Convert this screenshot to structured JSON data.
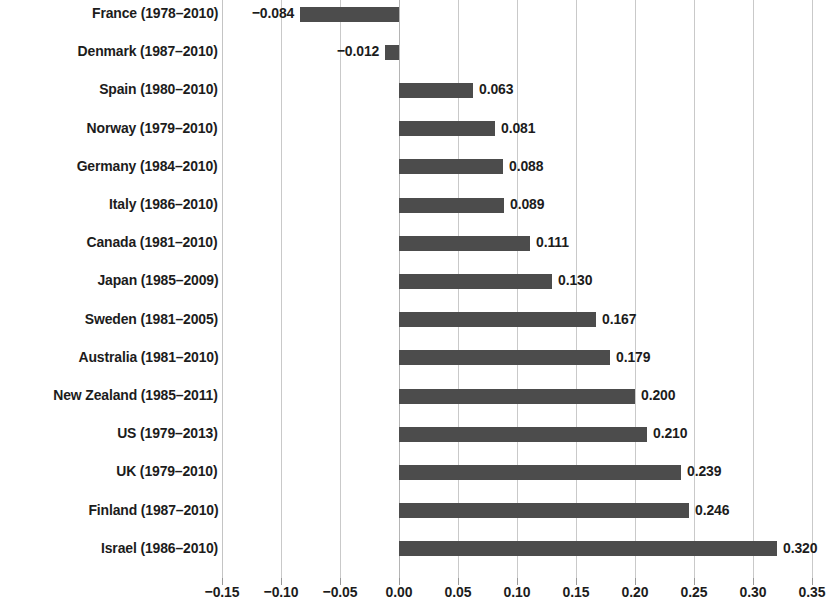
{
  "chart_data": {
    "type": "bar",
    "orientation": "horizontal",
    "title": "",
    "subtitle": "",
    "xlabel": "",
    "ylabel": "",
    "xlim": [
      -0.15,
      0.35
    ],
    "xticks": [
      "-0.15",
      "-0.10",
      "-0.05",
      "0.00",
      "0.05",
      "0.10",
      "0.15",
      "0.20",
      "0.25",
      "0.30",
      "0.35"
    ],
    "xtick_values": [
      -0.15,
      -0.1,
      -0.05,
      0.0,
      0.05,
      0.1,
      0.15,
      0.2,
      0.25,
      0.3,
      0.35
    ],
    "grid": "vertical",
    "legend": "none",
    "bar_color": "#4c4c4c",
    "categories": [
      "France (1978–2010)",
      "Denmark (1987–2010)",
      "Spain (1980–2010)",
      "Norway (1979–2010)",
      "Germany (1984–2010)",
      "Italy (1986–2010)",
      "Canada (1981–2010)",
      "Japan (1985–2009)",
      "Sweden (1981–2005)",
      "Australia (1981–2010)",
      "New Zealand (1985–2011)",
      "US (1979–2013)",
      "UK (1979–2010)",
      "Finland (1987–2010)",
      "Israel (1986–2010)"
    ],
    "values": [
      -0.084,
      -0.012,
      0.063,
      0.081,
      0.088,
      0.089,
      0.111,
      0.13,
      0.167,
      0.179,
      0.2,
      0.21,
      0.239,
      0.246,
      0.32
    ],
    "value_labels": [
      "−0.084",
      "−0.012",
      "0.063",
      "0.081",
      "0.088",
      "0.089",
      "0.111",
      "0.130",
      "0.167",
      "0.179",
      "0.200",
      "0.210",
      "0.239",
      "0.246",
      "0.320"
    ]
  }
}
